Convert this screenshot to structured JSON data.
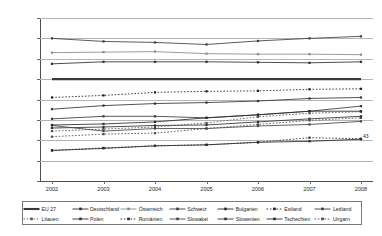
{
  "chart_data": {
    "type": "line",
    "title": "",
    "subtitle": "",
    "xlabel": "",
    "ylabel": "",
    "x": [
      "2002",
      "2003",
      "2004",
      "2005",
      "2006",
      "2007",
      "2008"
    ],
    "xtick_labels": [
      "2002",
      "2003",
      "2004",
      "2005",
      "2006",
      "2007",
      "2008"
    ],
    "ytick_labels": [
      "0%",
      "20%",
      "40%",
      "60%",
      "80%",
      "100%",
      "120%",
      "140%",
      "160%"
    ],
    "ytick_values": [
      0,
      20,
      40,
      60,
      80,
      100,
      120,
      140,
      160
    ],
    "ylim": [
      0,
      160
    ],
    "grid": true,
    "legend_position": "bottom",
    "value_unit": "%",
    "series": [
      {
        "name": "EU 27",
        "style": "solid-thick",
        "marker": "none",
        "color": "#3a3a3a",
        "values": [
          100,
          100,
          100,
          100,
          100,
          100,
          100
        ]
      },
      {
        "name": "Deutschland",
        "style": "solid",
        "marker": "square",
        "color": "#2e2e2e",
        "values": [
          115,
          117,
          117,
          117,
          116.5,
          116,
          117
        ]
      },
      {
        "name": "Österreich",
        "style": "solid",
        "marker": "square",
        "color": "#8a8a8a",
        "values": [
          126,
          126.5,
          127,
          125,
          124.5,
          124.5,
          124
        ]
      },
      {
        "name": "Schweiz",
        "style": "solid",
        "marker": "square",
        "color": "#3f3f3f",
        "values": [
          140,
          137,
          136,
          134,
          137.5,
          140,
          142
        ]
      },
      {
        "name": "Bulgarien",
        "style": "solid",
        "marker": "square",
        "color": "#262626",
        "values": [
          30,
          32,
          34.5,
          35.5,
          38,
          39,
          41
        ]
      },
      {
        "name": "Estland",
        "style": "dotted",
        "marker": "square",
        "color": "#1f1f1f",
        "values": [
          82,
          84,
          87,
          88,
          88.5,
          90,
          90.5
        ]
      },
      {
        "name": "Lettland",
        "style": "solid",
        "marker": "square",
        "color": "#3a3a3a",
        "values": [
          61,
          63.5,
          63.5,
          62,
          65,
          68.5,
          73.5
        ]
      },
      {
        "name": "Litauen",
        "style": "dotted",
        "marker": "square",
        "color": "#555555",
        "values": [
          49,
          51,
          53,
          57,
          63,
          66.5,
          68
        ]
      },
      {
        "name": "Polen",
        "style": "solid",
        "marker": "square",
        "color": "#303030",
        "values": [
          52,
          53,
          54.5,
          55,
          58,
          61,
          63.5
        ]
      },
      {
        "name": "Rumänien",
        "style": "dotted",
        "marker": "square",
        "color": "#2a2a2a",
        "values": [
          30,
          32.5,
          34.5,
          35.5,
          38,
          42.5,
          41.5
        ]
      },
      {
        "name": "Slowakei",
        "style": "solid",
        "marker": "square",
        "color": "#464646",
        "values": [
          54.5,
          49,
          51.5,
          51.5,
          54,
          55.5,
          58.5
        ]
      },
      {
        "name": "Slowenien",
        "style": "solid",
        "marker": "square",
        "color": "#343434",
        "values": [
          70.5,
          74,
          76,
          77,
          78.5,
          81,
          82
        ]
      },
      {
        "name": "Tschechien",
        "style": "solid",
        "marker": "square",
        "color": "#2b2b2b",
        "values": [
          55,
          56,
          58,
          62,
          65,
          68.5,
          68.5
        ]
      },
      {
        "name": "Ungarn",
        "style": "dotted",
        "marker": "square",
        "color": "#4a4a4a",
        "values": [
          43.5,
          46,
          47,
          51.5,
          55.5,
          59.5,
          62
        ]
      }
    ],
    "annotations": [
      {
        "text": "43",
        "x": 2008,
        "y": 44
      }
    ]
  },
  "legend": {
    "row1": [
      "EU 27",
      "Deutschland",
      "Österreich",
      "Schweiz",
      "Bulgarien",
      "Estland",
      "Lettland"
    ],
    "row2": [
      "Litauen",
      "Polen",
      "Rumänien",
      "Slowakei",
      "Slowenien",
      "Tschechien",
      "Ungarn"
    ]
  }
}
